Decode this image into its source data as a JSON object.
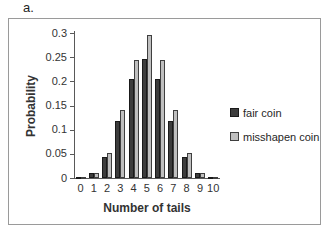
{
  "figure_label": "a.",
  "chart_data": {
    "type": "bar",
    "title": "",
    "xlabel": "Number of tails",
    "ylabel": "Probability",
    "categories": [
      "0",
      "1",
      "2",
      "3",
      "4",
      "5",
      "6",
      "7",
      "8",
      "9",
      "10"
    ],
    "series": [
      {
        "name": "fair coin",
        "color": "#3d3d3d",
        "border_color": "#1a1a1a",
        "values": [
          0.001,
          0.01,
          0.044,
          0.117,
          0.205,
          0.246,
          0.205,
          0.117,
          0.044,
          0.01,
          0.001
        ]
      },
      {
        "name": "misshapen coin",
        "color": "#bfbfbf",
        "border_color": "#3f3f3f",
        "values": [
          0.001,
          0.011,
          0.052,
          0.14,
          0.245,
          0.295,
          0.245,
          0.14,
          0.052,
          0.011,
          0.002
        ]
      }
    ],
    "ylim": [
      0,
      0.3
    ],
    "yticks": [
      0,
      0.05,
      0.1,
      0.15,
      0.2,
      0.25,
      0.3
    ],
    "ytick_labels": [
      "0",
      "0.05",
      "0.1",
      "0.15",
      "0.2",
      "0.25",
      "0.3"
    ],
    "legend_position": "right",
    "grid": false,
    "axis_color": "#595959",
    "text_color": "#333333"
  }
}
